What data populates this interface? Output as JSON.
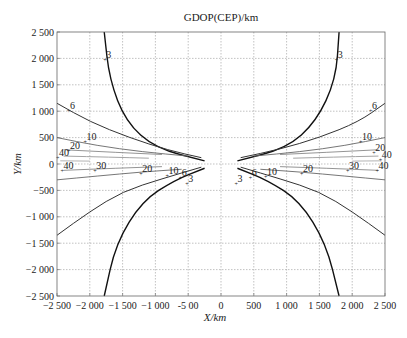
{
  "chart_data": {
    "type": "contour",
    "title": "GDOP(CEP)/km",
    "xlabel": "X/km",
    "ylabel": "Y/km",
    "xlim": [
      -2500,
      2500
    ],
    "ylim": [
      -2500,
      2500
    ],
    "grid": true,
    "x_ticks": [
      -2500,
      -2000,
      -1500,
      -1000,
      -500,
      0,
      500,
      1000,
      1500,
      2000,
      2500
    ],
    "x_tick_labels": [
      "−2 500",
      "−2 000",
      "−1 500",
      "−1 000",
      "-5 00",
      "0",
      "500",
      "1 000",
      "1 500",
      "2 000",
      "2 500"
    ],
    "y_ticks": [
      2500,
      2000,
      1500,
      1000,
      500,
      0,
      -500,
      -1000,
      -1500,
      -2000,
      -2500
    ],
    "y_tick_labels": [
      "2 500",
      "2 000",
      "1 500",
      "1 000",
      "500",
      "0",
      "−500",
      "−1 000",
      "−1 500",
      "−2 000",
      "−2 500"
    ],
    "levels": [
      3,
      6,
      10,
      20,
      30,
      40
    ],
    "series": [
      {
        "name": "3-left",
        "level": 3,
        "color": "#111111",
        "points": [
          [
            -1780,
            2500
          ],
          [
            -1700,
            1600
          ],
          [
            -1450,
            800
          ],
          [
            -1000,
            300
          ],
          [
            -250,
            60
          ]
        ]
      },
      {
        "name": "3-left-lower",
        "level": 3,
        "color": "#111111",
        "points": [
          [
            -250,
            -80
          ],
          [
            -700,
            -300
          ],
          [
            -1200,
            -700
          ],
          [
            -1600,
            -1500
          ],
          [
            -1780,
            -2500
          ]
        ]
      },
      {
        "name": "3-right",
        "level": 3,
        "color": "#111111",
        "points": [
          [
            1800,
            2500
          ],
          [
            1750,
            1600
          ],
          [
            1450,
            800
          ],
          [
            1000,
            300
          ],
          [
            250,
            60
          ]
        ]
      },
      {
        "name": "3-right-lower",
        "level": 3,
        "color": "#111111",
        "points": [
          [
            250,
            -80
          ],
          [
            700,
            -300
          ],
          [
            1200,
            -700
          ],
          [
            1600,
            -1500
          ],
          [
            1800,
            -2500
          ]
        ]
      },
      {
        "name": "6-left",
        "level": 6,
        "color": "#333333",
        "points": [
          [
            -2500,
            1150
          ],
          [
            -2000,
            800
          ],
          [
            -1400,
            500
          ],
          [
            -800,
            260
          ],
          [
            -300,
            120
          ]
        ]
      },
      {
        "name": "6-left-lower",
        "level": 6,
        "color": "#333333",
        "points": [
          [
            -300,
            -60
          ],
          [
            -900,
            -280
          ],
          [
            -1500,
            -520
          ],
          [
            -2000,
            -900
          ],
          [
            -2500,
            -1350
          ]
        ]
      },
      {
        "name": "6-right",
        "level": 6,
        "color": "#333333",
        "points": [
          [
            300,
            120
          ],
          [
            900,
            280
          ],
          [
            1500,
            500
          ],
          [
            2100,
            800
          ],
          [
            2500,
            1150
          ]
        ]
      },
      {
        "name": "6-right-lower",
        "level": 6,
        "color": "#333333",
        "points": [
          [
            300,
            -60
          ],
          [
            900,
            -280
          ],
          [
            1500,
            -520
          ],
          [
            2000,
            -900
          ],
          [
            2500,
            -1350
          ]
        ]
      },
      {
        "name": "10-left",
        "level": 10,
        "color": "#666666",
        "points": [
          [
            -2500,
            500
          ],
          [
            -1900,
            350
          ],
          [
            -1200,
            230
          ],
          [
            -500,
            150
          ]
        ]
      },
      {
        "name": "10-left-lower",
        "level": 10,
        "color": "#666666",
        "points": [
          [
            -2500,
            -300
          ],
          [
            -1900,
            -230
          ],
          [
            -1200,
            -150
          ],
          [
            -600,
            -100
          ]
        ]
      },
      {
        "name": "10-right",
        "level": 10,
        "color": "#666666",
        "points": [
          [
            500,
            150
          ],
          [
            1200,
            230
          ],
          [
            1900,
            350
          ],
          [
            2500,
            500
          ]
        ]
      },
      {
        "name": "10-right-lower",
        "level": 10,
        "color": "#666666",
        "points": [
          [
            600,
            -100
          ],
          [
            1200,
            -150
          ],
          [
            1900,
            -230
          ],
          [
            2500,
            -300
          ]
        ]
      },
      {
        "name": "20-left",
        "level": 20,
        "color": "#888888",
        "points": [
          [
            -2400,
            270
          ],
          [
            -1600,
            220
          ],
          [
            -900,
            180
          ]
        ]
      },
      {
        "name": "20-left-lower",
        "level": 20,
        "color": "#888888",
        "points": [
          [
            -2400,
            -120
          ],
          [
            -1600,
            -80
          ],
          [
            -900,
            -50
          ]
        ]
      },
      {
        "name": "20-right",
        "level": 20,
        "color": "#888888",
        "points": [
          [
            900,
            180
          ],
          [
            1600,
            220
          ],
          [
            2400,
            270
          ]
        ]
      },
      {
        "name": "20-right-lower",
        "level": 20,
        "color": "#888888",
        "points": [
          [
            900,
            -50
          ],
          [
            1600,
            -80
          ],
          [
            2400,
            -120
          ]
        ]
      },
      {
        "name": "30-left",
        "level": 30,
        "color": "#999999",
        "points": [
          [
            -2400,
            150
          ],
          [
            -1700,
            130
          ],
          [
            -1100,
            110
          ]
        ]
      },
      {
        "name": "30-right",
        "level": 30,
        "color": "#999999",
        "points": [
          [
            1100,
            110
          ],
          [
            1700,
            130
          ],
          [
            2400,
            150
          ]
        ]
      },
      {
        "name": "40-left",
        "level": 40,
        "color": "#aaaaaa",
        "points": [
          [
            -2450,
            60
          ],
          [
            -2000,
            55
          ]
        ]
      },
      {
        "name": "40-right",
        "level": 40,
        "color": "#aaaaaa",
        "points": [
          [
            2000,
            55
          ],
          [
            2450,
            60
          ]
        ]
      }
    ],
    "contour_labels": [
      {
        "text": "3",
        "x": -1750,
        "y": 2000
      },
      {
        "text": "3",
        "x": 1780,
        "y": 2000
      },
      {
        "text": "6",
        "x": -2300,
        "y": 1050
      },
      {
        "text": "6",
        "x": 2300,
        "y": 1050
      },
      {
        "text": "10",
        "x": -2050,
        "y": 450
      },
      {
        "text": "10",
        "x": 2150,
        "y": 450
      },
      {
        "text": "20",
        "x": -2300,
        "y": 280
      },
      {
        "text": "20",
        "x": 2350,
        "y": 250
      },
      {
        "text": "40",
        "x": -2470,
        "y": 150
      },
      {
        "text": "40",
        "x": 2450,
        "y": 120
      },
      {
        "text": "40",
        "x": -2400,
        "y": -100
      },
      {
        "text": "40",
        "x": 2400,
        "y": -100
      },
      {
        "text": "30",
        "x": -1900,
        "y": -100
      },
      {
        "text": "30",
        "x": 1950,
        "y": -100
      },
      {
        "text": "20",
        "x": -1200,
        "y": -150
      },
      {
        "text": "20",
        "x": 1250,
        "y": -150
      },
      {
        "text": "10",
        "x": -800,
        "y": -180
      },
      {
        "text": "10",
        "x": 700,
        "y": -210
      },
      {
        "text": "6",
        "x": -600,
        "y": -230
      },
      {
        "text": "6",
        "x": 470,
        "y": -230
      },
      {
        "text": "3",
        "x": -500,
        "y": -340
      },
      {
        "text": "3",
        "x": 250,
        "y": -340
      }
    ]
  }
}
